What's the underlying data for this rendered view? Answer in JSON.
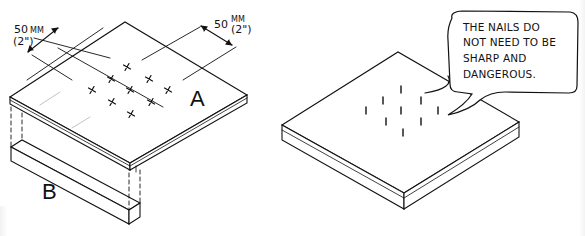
{
  "figure": {
    "left_panel": {
      "board_label": "A",
      "batten_label": "B",
      "dimension_left": {
        "value": "50",
        "unit": "MM",
        "imperial": "(2\")"
      },
      "dimension_right": {
        "value": "50",
        "unit": "MM",
        "imperial": "(2\")"
      },
      "nail_marks": 10,
      "nail_mark_symbol": "×"
    },
    "right_panel": {
      "speech_bubble": {
        "lines": [
          "THE NAILS DO",
          "NOT NEED TO BE",
          "SHARP AND",
          "DANGEROUS."
        ]
      },
      "nails": 9
    }
  },
  "colors": {
    "ink": "#111111",
    "paper": "#ffffff"
  }
}
